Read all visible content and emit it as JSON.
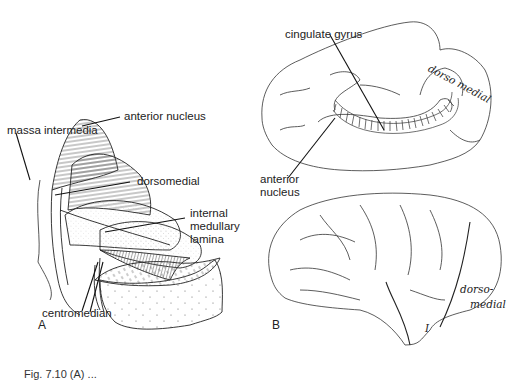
{
  "figure": {
    "caption": "Fig. 7.10 (A) ...",
    "panel_a": {
      "letter": "A",
      "labels": {
        "massa_intermedia": "massa intermedia",
        "anterior_nucleus": "anterior nucleus",
        "dorsomedial": "dorsomedial",
        "internal_medullary_1": "internal",
        "internal_medullary_2": "medullary",
        "internal_medullary_3": "lamina",
        "centromedian": "centromedian"
      }
    },
    "panel_b": {
      "letter": "B",
      "labels": {
        "cingulate_gyrus": "cingulate gyrus",
        "anterior_nucleus_1": "anterior",
        "anterior_nucleus_2": "nucleus",
        "dorsomedial_medial_view": "dorso medial",
        "dorsomedial_lateral_1": "dorso-",
        "dorsomedial_lateral_2": "medial",
        "insula_mark": "I"
      }
    }
  }
}
